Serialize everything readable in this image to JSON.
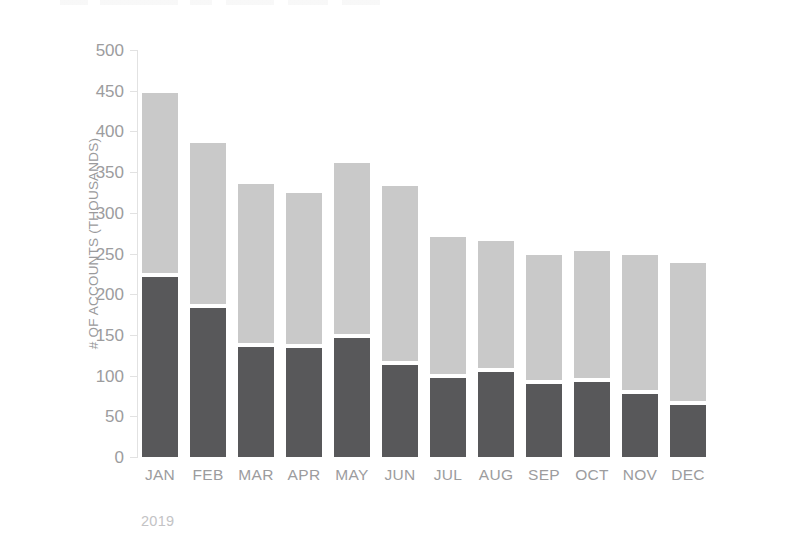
{
  "chart_data": {
    "type": "bar",
    "subtype": "stacked-bar-vertical",
    "title": "",
    "subtitle": "",
    "xlabel": "",
    "ylabel": "# OF ACCOUNTS (THOUSANDS)",
    "period_caption": "2019",
    "categories": [
      "JAN",
      "FEB",
      "MAR",
      "APR",
      "MAY",
      "JUN",
      "JUL",
      "AUG",
      "SEP",
      "OCT",
      "NOV",
      "DEC"
    ],
    "series": [
      {
        "name": "dark-segment",
        "color": "#58585a",
        "stack_order": "bottom",
        "values": [
          221,
          183,
          135,
          134,
          146,
          113,
          97,
          104,
          90,
          92,
          77,
          64
        ]
      },
      {
        "name": "light-segment",
        "color": "#c9c9c9",
        "stack_order": "top",
        "values": [
          226,
          203,
          200,
          190,
          215,
          220,
          173,
          161,
          158,
          161,
          171,
          174
        ]
      }
    ],
    "totals": [
      447,
      386,
      335,
      324,
      361,
      333,
      270,
      265,
      248,
      253,
      248,
      238
    ],
    "ylim": [
      0,
      500
    ],
    "ytick_values": [
      0,
      50,
      100,
      150,
      200,
      250,
      300,
      350,
      400,
      450,
      500
    ],
    "ytick_labels": [
      "0",
      "50",
      "100",
      "150",
      "200",
      "250",
      "300",
      "350",
      "400",
      "450",
      "500"
    ],
    "grid": false,
    "legend": null,
    "legend_position": "none",
    "annotations": []
  },
  "style": {
    "background": "#ffffff",
    "axis_color": "#e2e2e2",
    "tick_label_color": "#9c9c9e",
    "axis_title_color": "#9a9a9c",
    "caption_color": "#c3c3c5",
    "color_dark": "#58585a",
    "color_light": "#c9c9c9"
  }
}
